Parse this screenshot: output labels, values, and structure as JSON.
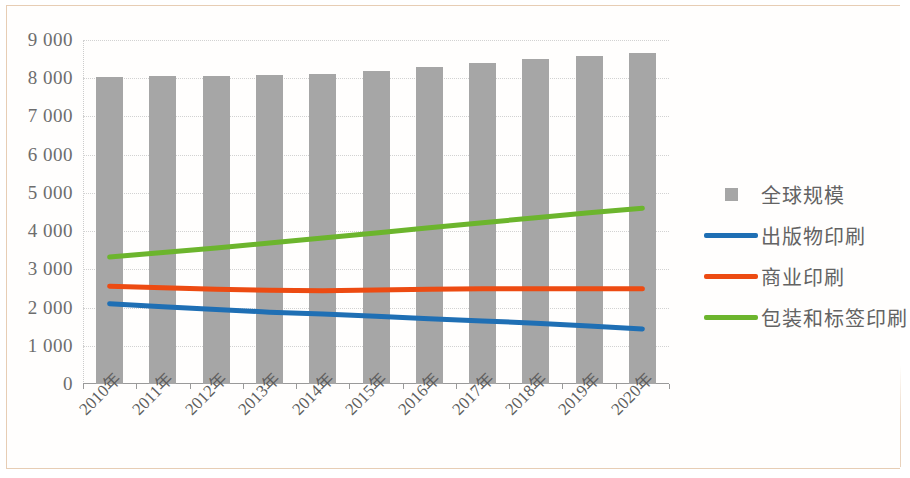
{
  "chart_data": {
    "type": "bar",
    "title": "",
    "subtitle": "",
    "xlabel": "",
    "ylabel": "",
    "ylim": [
      0,
      9000
    ],
    "ytick_step": 1000,
    "grid": true,
    "legend_position": "right",
    "categories": [
      "2010年",
      "2011年",
      "2012年",
      "2013年",
      "2014年",
      "2015年",
      "2016年",
      "2017年",
      "2018年",
      "2019年",
      "2020年"
    ],
    "ytick_labels": [
      "9 000",
      "8 000",
      "7 000",
      "6 000",
      "5 000",
      "4 000",
      "3 000",
      "2 000",
      "1 000",
      "0"
    ],
    "ytick_values": [
      9000,
      8000,
      7000,
      6000,
      5000,
      4000,
      3000,
      2000,
      1000,
      0
    ],
    "series": [
      {
        "name": "全球规模",
        "kind": "bar",
        "color": "#a6a6a6",
        "values": [
          8040,
          8050,
          8060,
          8080,
          8110,
          8180,
          8290,
          8390,
          8500,
          8590,
          8650
        ]
      },
      {
        "name": "出版物印刷",
        "kind": "line",
        "color": "#1f6fb4",
        "values": [
          2100,
          2020,
          1950,
          1880,
          1830,
          1770,
          1710,
          1650,
          1590,
          1520,
          1440
        ]
      },
      {
        "name": "商业印刷",
        "kind": "line",
        "color": "#ed4b12",
        "values": [
          2560,
          2520,
          2480,
          2450,
          2440,
          2460,
          2480,
          2490,
          2490,
          2490,
          2490
        ]
      },
      {
        "name": "包装和标签印刷",
        "kind": "line",
        "color": "#6cb52d",
        "values": [
          3320,
          3440,
          3560,
          3690,
          3820,
          3950,
          4090,
          4220,
          4350,
          4480,
          4600
        ]
      }
    ]
  },
  "legend": {
    "items": [
      {
        "label": "全球规模",
        "key": "square",
        "color": "#a6a6a6"
      },
      {
        "label": "出版物印刷",
        "key": "line",
        "color": "#1f6fb4"
      },
      {
        "label": "商业印刷",
        "key": "line",
        "color": "#ed4b12"
      },
      {
        "label": "包装和标签印刷",
        "key": "line",
        "color": "#6cb52d"
      }
    ]
  }
}
